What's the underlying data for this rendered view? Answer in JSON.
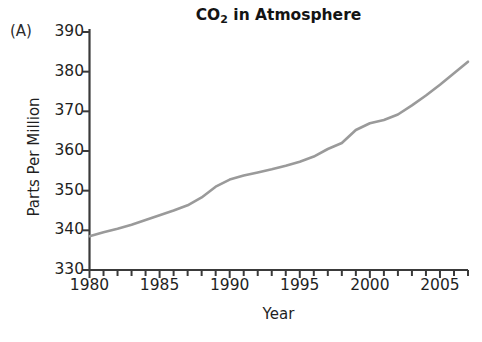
{
  "panel": {
    "label": "(A)"
  },
  "chart_data": {
    "type": "line",
    "title": "CO2 in Atmosphere",
    "title_prefix": "CO",
    "title_subscript": "2",
    "title_suffix": " in Atmosphere",
    "xlabel": "Year",
    "ylabel": "Parts Per Million",
    "xlim": [
      1980,
      2007
    ],
    "ylim": [
      330,
      390
    ],
    "grid": false,
    "legend": false,
    "line_color": "#9a9a9a",
    "axis_color": "#3a3a3a",
    "background": "#ffffff",
    "xticks": [
      1980,
      1985,
      1990,
      1995,
      2000,
      2005
    ],
    "xtick_labels": [
      "1980",
      "1985",
      "1990",
      "1995",
      "2000",
      "2005"
    ],
    "xminor_step": 1,
    "yticks": [
      330,
      340,
      350,
      360,
      370,
      380,
      390
    ],
    "ytick_labels": [
      "330",
      "340",
      "350",
      "360",
      "370",
      "380",
      "390"
    ],
    "series": [
      {
        "name": "Atmospheric CO2",
        "x": [
          1980,
          1981,
          1982,
          1983,
          1984,
          1985,
          1986,
          1987,
          1988,
          1989,
          1990,
          1991,
          1992,
          1993,
          1994,
          1995,
          1996,
          1997,
          1998,
          1999,
          2000,
          2001,
          2002,
          2003,
          2004,
          2005,
          2006,
          2007
        ],
        "values": [
          338.5,
          339.5,
          340.4,
          341.4,
          342.6,
          343.8,
          345.0,
          346.3,
          348.3,
          351.0,
          352.8,
          353.8,
          354.6,
          355.4,
          356.3,
          357.3,
          358.6,
          360.5,
          362.0,
          365.3,
          367.0,
          367.8,
          369.2,
          371.5,
          374.0,
          376.7,
          379.6,
          382.5
        ]
      }
    ]
  }
}
